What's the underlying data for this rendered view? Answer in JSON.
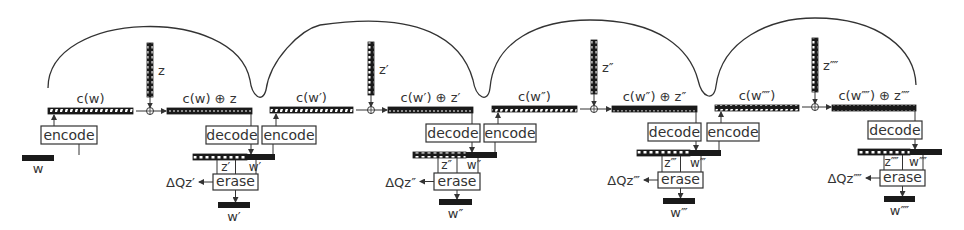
{
  "diagram": {
    "title": "",
    "colors": {
      "line": "#333333",
      "bar_dark": "#1a1a1a",
      "bar_light": "#ffffff",
      "text": "#333333"
    },
    "arcs": [
      {
        "d": "M 48 88 C 48 10, 235 5, 250 80 C 252 96, 262 104, 266 90 C 270 60, 300 30, 320 25"
      },
      {
        "d": "M 320 25 C 420 10, 462 40, 473 80 C 476 98, 488 104, 490 88 C 494 40, 540 20, 590 20"
      },
      {
        "d": "M 590 20 C 660 20, 690 50, 698 80 C 702 98, 714 102, 716 86 C 722 40, 770 18, 815 18 C 880 18, 915 50, 916 85"
      }
    ],
    "stages": [
      {
        "id": "stage-1",
        "input_word": {
          "label": "w",
          "x": 22,
          "y": 155,
          "w": 32
        },
        "encode_box": {
          "label": "encode",
          "x": 41,
          "y": 126,
          "w": 56,
          "h": 18
        },
        "code_bar": {
          "label": "c(w)",
          "x": 48,
          "y": 108,
          "w": 85
        },
        "noise_bar": {
          "label": "z",
          "x": 147,
          "y": 43,
          "h": 54
        },
        "oplus": {
          "x": 150,
          "y": 111
        },
        "sum_bar": {
          "label": "c(w) ⊕ z",
          "x": 167,
          "y": 108,
          "w": 85
        },
        "decode_box": {
          "label": "decode",
          "x": 206,
          "y": 126,
          "w": 52,
          "h": 18
        },
        "mixed_bar": {
          "x": 193,
          "y": 154,
          "w": 82,
          "split": 247,
          "z_label": "z′",
          "w_label": "w′"
        },
        "erase_box": {
          "label": "erase",
          "x": 213,
          "y": 174,
          "w": 45,
          "h": 16
        },
        "delta_label": "ΔQz′",
        "output_word": {
          "label": "w′",
          "x": 218,
          "y": 202,
          "w": 32
        }
      },
      {
        "id": "stage-2",
        "encode_box": {
          "label": "encode",
          "x": 262,
          "y": 126,
          "w": 54,
          "h": 18
        },
        "code_bar": {
          "label": "c(w′)",
          "x": 270,
          "y": 107,
          "w": 83
        },
        "noise_bar": {
          "label": "z′",
          "x": 368,
          "y": 42,
          "h": 53
        },
        "oplus": {
          "x": 371,
          "y": 110
        },
        "sum_bar": {
          "label": "c(w′) ⊕ z′",
          "x": 388,
          "y": 107,
          "w": 85
        },
        "decode_box": {
          "label": "decode",
          "x": 426,
          "y": 124,
          "w": 54,
          "h": 18
        },
        "mixed_bar": {
          "x": 413,
          "y": 152,
          "w": 84,
          "split": 466,
          "z_label": "z″",
          "w_label": "w″"
        },
        "erase_box": {
          "label": "erase",
          "x": 434,
          "y": 173,
          "w": 46,
          "h": 17
        },
        "delta_label": "ΔQz″",
        "output_word": {
          "label": "w″",
          "x": 439,
          "y": 199,
          "w": 33
        }
      },
      {
        "id": "stage-3",
        "encode_box": {
          "label": "encode",
          "x": 484,
          "y": 124,
          "w": 52,
          "h": 18
        },
        "code_bar": {
          "label": "c(w″)",
          "x": 492,
          "y": 106,
          "w": 85
        },
        "noise_bar": {
          "label": "z″",
          "x": 591,
          "y": 40,
          "h": 54
        },
        "oplus": {
          "x": 594,
          "y": 109
        },
        "sum_bar": {
          "label": "c(w″) ⊕ z″",
          "x": 612,
          "y": 106,
          "w": 85
        },
        "decode_box": {
          "label": "decode",
          "x": 648,
          "y": 123,
          "w": 53,
          "h": 18
        },
        "mixed_bar": {
          "x": 637,
          "y": 150,
          "w": 84,
          "split": 690,
          "z_label": "z‴",
          "w_label": "w‴"
        },
        "erase_box": {
          "label": "erase",
          "x": 658,
          "y": 172,
          "w": 45,
          "h": 16
        },
        "delta_label": "ΔQz‴",
        "output_word": {
          "label": "w‴",
          "x": 663,
          "y": 198,
          "w": 32
        }
      },
      {
        "id": "stage-4",
        "encode_box": {
          "label": "encode",
          "x": 707,
          "y": 123,
          "w": 52,
          "h": 18
        },
        "code_bar": {
          "label": "c(w⁗)",
          "x": 715,
          "y": 105,
          "w": 84
        },
        "noise_bar": {
          "label": "z⁗",
          "x": 812,
          "y": 38,
          "h": 54
        },
        "oplus": {
          "x": 815,
          "y": 107
        },
        "sum_bar": {
          "label": "c(w⁗) ⊕ z⁗",
          "x": 832,
          "y": 105,
          "w": 84
        },
        "decode_box": {
          "label": "decode",
          "x": 868,
          "y": 121,
          "w": 54,
          "h": 18
        },
        "mixed_bar": {
          "x": 858,
          "y": 149,
          "w": 84,
          "split": 910,
          "z_label": "z⁗",
          "w_label": "w⁗"
        },
        "erase_box": {
          "label": "erase",
          "x": 880,
          "y": 170,
          "w": 45,
          "h": 16
        },
        "delta_label": "ΔQz⁗",
        "output_word": {
          "label": "w⁗",
          "x": 884,
          "y": 196,
          "w": 31
        }
      }
    ]
  }
}
